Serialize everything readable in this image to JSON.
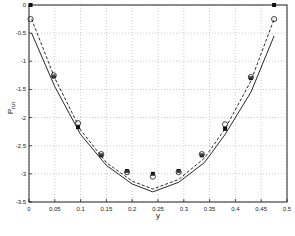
{
  "chart_data": {
    "type": "line",
    "title": "",
    "xlabel": "y",
    "ylabel": "P",
    "ylabel_sub": "n,n",
    "xlim": [
      0,
      0.5
    ],
    "ylim": [
      -3.5,
      0
    ],
    "grid": true,
    "legend": null,
    "x_ticks": [
      "0",
      "0.05",
      "0.1",
      "0.15",
      "0.2",
      "0.25",
      "0.3",
      "0.35",
      "0.4",
      "0.45",
      "0.5"
    ],
    "y_ticks": [
      "0",
      "-0.5",
      "-1",
      "-1.5",
      "-2",
      "-2.5",
      "-3",
      "-3.5"
    ],
    "series": [
      {
        "name": "solid-curve",
        "style": "solid",
        "x": [
          0.005,
          0.05,
          0.1,
          0.15,
          0.2,
          0.24,
          0.29,
          0.34,
          0.38,
          0.43,
          0.475
        ],
        "y": [
          -0.5,
          -1.45,
          -2.3,
          -2.85,
          -3.18,
          -3.32,
          -3.15,
          -2.8,
          -2.3,
          -1.55,
          -0.55
        ]
      },
      {
        "name": "dashed-curve",
        "style": "dashed",
        "x": [
          0.005,
          0.05,
          0.1,
          0.15,
          0.2,
          0.24,
          0.29,
          0.34,
          0.38,
          0.43,
          0.475
        ],
        "y": [
          -0.25,
          -1.3,
          -2.22,
          -2.8,
          -3.13,
          -3.27,
          -3.1,
          -2.72,
          -2.2,
          -1.35,
          -0.25
        ]
      },
      {
        "name": "filled-markers",
        "style": "marker-filled",
        "x": [
          0.003,
          0.048,
          0.095,
          0.14,
          0.19,
          0.24,
          0.29,
          0.335,
          0.38,
          0.43,
          0.475
        ],
        "y": [
          0.0,
          -1.27,
          -2.17,
          -2.67,
          -2.95,
          -3.0,
          -2.95,
          -2.67,
          -2.2,
          -1.3,
          0.0
        ]
      },
      {
        "name": "open-markers",
        "style": "marker-open",
        "x": [
          0.003,
          0.048,
          0.095,
          0.14,
          0.19,
          0.24,
          0.29,
          0.335,
          0.38,
          0.43,
          0.475
        ],
        "y": [
          -0.25,
          -1.25,
          -2.1,
          -2.65,
          -2.97,
          -3.05,
          -2.97,
          -2.65,
          -2.12,
          -1.28,
          -0.25
        ]
      }
    ]
  }
}
